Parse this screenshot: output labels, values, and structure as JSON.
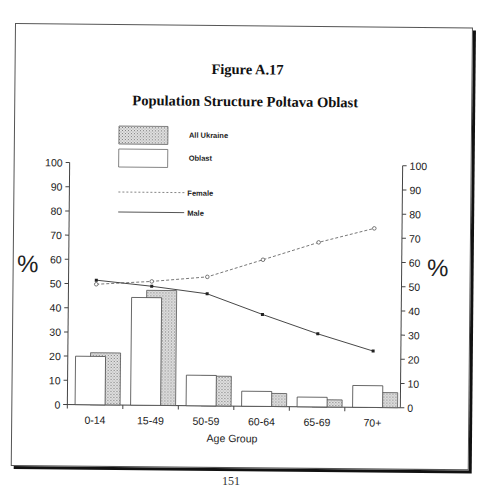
{
  "figure": {
    "label": "Figure A.17",
    "title": "Population Structure Poltava Oblast",
    "page_number": "151"
  },
  "colors": {
    "ukraine_fill": "#c9c9c9",
    "oblast_fill": "#ffffff",
    "line": "#333333",
    "frame": "#111111"
  },
  "chart_data": {
    "type": "bar+line",
    "title": "Population Structure Poltava Oblast",
    "subtitle": "Figure A.17",
    "xlabel": "Age Group",
    "ylabel": "%",
    "ylabel_right": "%",
    "ylim": [
      0,
      100
    ],
    "yticks": [
      0,
      10,
      20,
      30,
      40,
      50,
      60,
      70,
      80,
      90,
      100
    ],
    "grid": false,
    "legend_position": "top-left inside plot",
    "categories": [
      "0-14",
      "15-49",
      "50-59",
      "60-64",
      "65-69",
      "70+"
    ],
    "series": [
      {
        "name": "All Ukraine",
        "type": "bar",
        "style": "hatched grey",
        "values": [
          21.5,
          47.5,
          12.3,
          5.4,
          3.0,
          6.2
        ]
      },
      {
        "name": "Oblast",
        "type": "bar",
        "style": "white outline",
        "values": [
          20,
          44.5,
          12.6,
          6.2,
          4.0,
          9.0
        ]
      },
      {
        "name": "Female",
        "type": "line",
        "style": "dashed, open circle markers",
        "values": [
          49.8,
          51.2,
          53.3,
          60.6,
          68,
          74
        ]
      },
      {
        "name": "Male",
        "type": "line",
        "style": "solid, filled square markers",
        "values": [
          51.5,
          49.2,
          46.3,
          38,
          30.2,
          23.3
        ]
      }
    ]
  },
  "legend": [
    {
      "label": "All Ukraine",
      "kind": "bar-hatched"
    },
    {
      "label": "Oblast",
      "kind": "bar-white"
    },
    {
      "label": "Female",
      "kind": "line-dashed"
    },
    {
      "label": "Male",
      "kind": "line-solid"
    }
  ]
}
